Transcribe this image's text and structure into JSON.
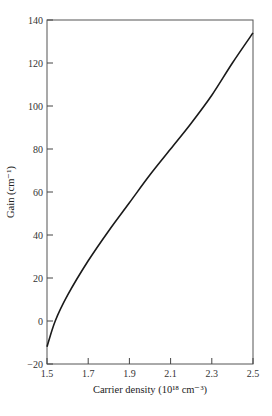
{
  "chart_data": {
    "type": "line",
    "title": "",
    "xlabel": "Carrier density (10¹⁸ cm⁻³)",
    "ylabel": "Gain (cm⁻¹)",
    "xlim": [
      1.5,
      2.5
    ],
    "ylim": [
      -20,
      140
    ],
    "xticks": [
      1.5,
      1.7,
      1.9,
      2.1,
      2.3,
      2.5
    ],
    "yticks": [
      -20,
      0,
      20,
      40,
      60,
      80,
      100,
      120,
      140
    ],
    "xtick_labels": [
      "1.5",
      "1.7",
      "1.9",
      "2.1",
      "2.3",
      "2.5"
    ],
    "ytick_labels": [
      "−20",
      "0",
      "20",
      "40",
      "60",
      "80",
      "100",
      "120",
      "140"
    ],
    "grid": false,
    "legend": null,
    "series": [
      {
        "name": "Gain",
        "x": [
          1.5,
          1.54,
          1.6,
          1.7,
          1.8,
          1.9,
          2.0,
          2.1,
          2.2,
          2.3,
          2.4,
          2.5
        ],
        "values": [
          -12,
          0,
          12,
          28,
          42,
          55,
          68,
          80,
          92,
          105,
          120,
          134
        ]
      }
    ]
  }
}
